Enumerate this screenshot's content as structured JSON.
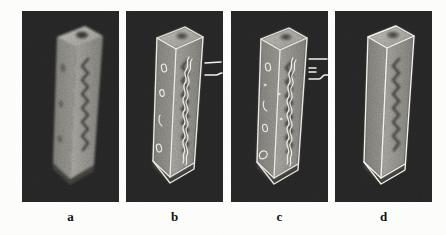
{
  "figure": {
    "background_color": "#fdfdfc",
    "panel_background_color": "#2b2b2b",
    "object_light_color": "#a9a7a2",
    "object_mid_color": "#8a8884",
    "object_dark_color": "#5d5b58",
    "overlay_color": "#f2f0ea",
    "caption_color": "#121212",
    "panels": [
      {
        "id": "a",
        "caption": "a",
        "content_kind": "grayscale-volume-rendering",
        "description": "blurred grayscale 3D rendering of an upright rectangular prism with a zigzag groove on its front face and a dark circular pit on its top face",
        "has_overlay_contours": false,
        "has_leader_marks": false
      },
      {
        "id": "b",
        "caption": "b",
        "content_kind": "rendering-with-extracted-contours",
        "description": "same prism with bright extracted contour lines tracing the silhouette, the zigzag groove and small oval surface features, plus two short horizontal marks at the right",
        "has_overlay_contours": true,
        "has_leader_marks": true,
        "leader_marks": 2
      },
      {
        "id": "c",
        "caption": "c",
        "content_kind": "rendering-with-extracted-contours",
        "description": "same prism with bright extracted contour lines and additional fragmented features, with a stepped bracket of marks at the right",
        "has_overlay_contours": true,
        "has_leader_marks": true,
        "leader_marks": 4
      },
      {
        "id": "d",
        "caption": "d",
        "content_kind": "rendering-with-wireframe-edges",
        "description": "same prism with only the clean straight wireframe box edges overlaid in white",
        "has_overlay_contours": true,
        "has_leader_marks": false
      }
    ]
  }
}
